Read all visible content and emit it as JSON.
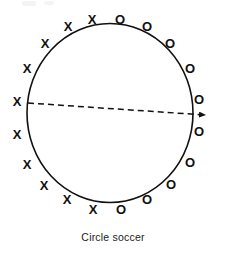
{
  "figure": {
    "caption": "Circle soccer",
    "type": "instructional-diagram",
    "background_color": "#ffffff",
    "ink_color": "#111111"
  },
  "circle": {
    "center_x": 110,
    "center_y": 113,
    "radius": 83,
    "stroke_width": 1.6,
    "stroke_color": "#111111",
    "fill": "none"
  },
  "ball_path": {
    "name": "dashed-ball-path",
    "style": "dashed",
    "dash_pattern": "6,4",
    "stroke_width": 1.5,
    "stroke_color": "#111111",
    "start_x": 28,
    "start_y": 103,
    "end_x": 205,
    "end_y": 115,
    "arrowhead": true,
    "arrow_tip_x": 213,
    "arrow_tip_y": 115
  },
  "teams": [
    {
      "name": "team-x",
      "symbol": "X",
      "count": 10,
      "side": "left",
      "positions": [
        {
          "x": 92,
          "y": 21
        },
        {
          "x": 68,
          "y": 28
        },
        {
          "x": 45,
          "y": 45
        },
        {
          "x": 27,
          "y": 70
        },
        {
          "x": 17,
          "y": 103
        },
        {
          "x": 17,
          "y": 136
        },
        {
          "x": 27,
          "y": 166
        },
        {
          "x": 44,
          "y": 187
        },
        {
          "x": 67,
          "y": 201
        },
        {
          "x": 93,
          "y": 211
        }
      ]
    },
    {
      "name": "team-o",
      "symbol": "O",
      "count": 10,
      "side": "right",
      "positions": [
        {
          "x": 120,
          "y": 21
        },
        {
          "x": 147,
          "y": 28
        },
        {
          "x": 170,
          "y": 45
        },
        {
          "x": 190,
          "y": 70
        },
        {
          "x": 199,
          "y": 101
        },
        {
          "x": 199,
          "y": 133
        },
        {
          "x": 190,
          "y": 164
        },
        {
          "x": 171,
          "y": 186
        },
        {
          "x": 147,
          "y": 201
        },
        {
          "x": 121,
          "y": 211
        }
      ]
    }
  ]
}
